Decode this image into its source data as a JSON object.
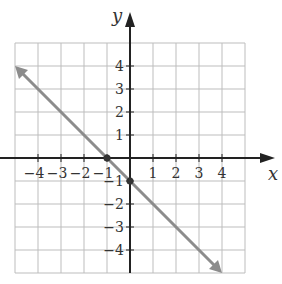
{
  "chart_data": {
    "type": "line",
    "title": "",
    "xlabel": "x",
    "ylabel": "y",
    "xlim": [
      -5,
      5
    ],
    "ylim": [
      -5,
      5
    ],
    "grid": true,
    "x_ticks": [
      "-4",
      "-3",
      "-2",
      "-1",
      "1",
      "2",
      "3",
      "4"
    ],
    "y_ticks": [
      "4",
      "3",
      "2",
      "1",
      "-1",
      "-2",
      "-3",
      "-4"
    ],
    "series": [
      {
        "name": "line",
        "equation": "y = -x - 1",
        "x": [
          -5,
          4
        ],
        "y": [
          4,
          -5
        ],
        "arrows": "both"
      }
    ],
    "points": [
      {
        "label": "x-intercept",
        "x": -1,
        "y": 0
      },
      {
        "label": "y-intercept",
        "x": 0,
        "y": -1
      }
    ]
  }
}
